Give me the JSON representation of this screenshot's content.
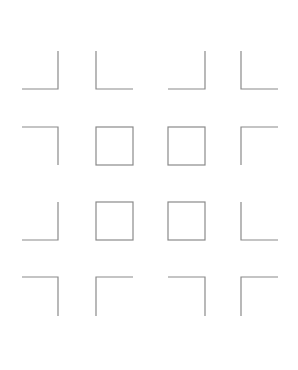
{
  "diagram": {
    "stroke_color": "#8a8a8a",
    "background": "#ffffff",
    "columns": [
      [
        22,
        58
      ],
      [
        96,
        133
      ],
      [
        168,
        205
      ],
      [
        241,
        278
      ]
    ],
    "rows": [
      [
        51,
        89
      ],
      [
        127,
        165
      ],
      [
        202,
        240
      ],
      [
        277,
        316
      ]
    ],
    "grid": [
      [
        "corner-bottom-right",
        "corner-bottom-left",
        "corner-bottom-right",
        "corner-bottom-left"
      ],
      [
        "corner-top-right",
        "square",
        "square",
        "corner-top-left"
      ],
      [
        "corner-bottom-right",
        "square",
        "square",
        "corner-bottom-left"
      ],
      [
        "corner-top-right",
        "corner-top-left",
        "corner-top-right",
        "corner-top-left"
      ]
    ]
  }
}
